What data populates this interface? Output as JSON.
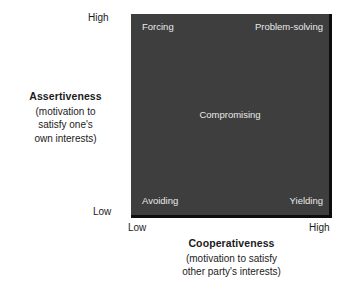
{
  "figure": {
    "type": "2x2-matrix-diagram",
    "background_color": "#ffffff",
    "plot_fill_color": "#3e3e3e",
    "axis_line_color": "#0d0d0d",
    "quadrant_label_color": "#e9e9e9",
    "text_color": "#1b1b1b"
  },
  "y_axis": {
    "name": "Assertiveness",
    "subtitle_line1": "(motivation to",
    "subtitle_line2": "satisfy one's",
    "subtitle_line3": "own interests)",
    "tick_high": "High",
    "tick_low": "Low"
  },
  "x_axis": {
    "name": "Cooperativeness",
    "subtitle_line1": "(motivation to satisfy",
    "subtitle_line2": "other party's interests)",
    "tick_low": "Low",
    "tick_high": "High"
  },
  "quadrants": {
    "top_left": "Forcing",
    "top_right": "Problem-solving",
    "center": "Compromising",
    "bottom_left": "Avoiding",
    "bottom_right": "Yielding"
  },
  "chart_data": {
    "type": "scatter",
    "title": "",
    "xlabel": "Cooperativeness (motivation to satisfy other party's interests)",
    "ylabel": "Assertiveness (motivation to satisfy one's own interests)",
    "xlim": [
      0,
      1
    ],
    "ylim": [
      0,
      1
    ],
    "x_tick_labels": [
      "Low",
      "High"
    ],
    "y_tick_labels": [
      "Low",
      "High"
    ],
    "grid": false,
    "legend": "none",
    "annotations": [
      {
        "label": "Forcing",
        "x": 0.08,
        "y": 0.95
      },
      {
        "label": "Problem-solving",
        "x": 0.86,
        "y": 0.95
      },
      {
        "label": "Compromising",
        "x": 0.5,
        "y": 0.52
      },
      {
        "label": "Avoiding",
        "x": 0.08,
        "y": 0.06
      },
      {
        "label": "Yielding",
        "x": 0.88,
        "y": 0.06
      }
    ]
  }
}
